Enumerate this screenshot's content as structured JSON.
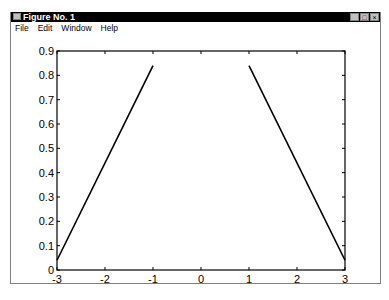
{
  "window": {
    "title": "Figure No. 1",
    "controls": {
      "minimize": "_",
      "maximize": "□",
      "close": "×"
    }
  },
  "menu": {
    "items": [
      "File",
      "Edit",
      "Window",
      "Help"
    ]
  },
  "chart_data": {
    "type": "line",
    "title": "",
    "xlabel": "",
    "ylabel": "",
    "xlim": [
      -3,
      3
    ],
    "ylim": [
      0,
      0.9
    ],
    "x_ticks": [
      "-3",
      "-2",
      "-1",
      "0",
      "1",
      "2",
      "3"
    ],
    "y_ticks": [
      "0",
      "0.1",
      "0.2",
      "0.3",
      "0.4",
      "0.5",
      "0.6",
      "0.7",
      "0.8",
      "0.9"
    ],
    "grid": false,
    "legend": null,
    "series": [
      {
        "name": "segment-left",
        "x": [
          -3,
          -1
        ],
        "y": [
          0.04,
          0.84
        ],
        "color": "#000000"
      },
      {
        "name": "segment-right",
        "x": [
          1,
          3
        ],
        "y": [
          0.84,
          0.04
        ],
        "color": "#000000"
      }
    ]
  }
}
